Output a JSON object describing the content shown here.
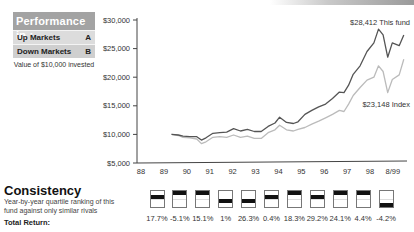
{
  "performance_box": {
    "title": "Performance in :",
    "rows": [
      {
        "label": "Up Markets",
        "grade": "A"
      },
      {
        "label": "Down Markets",
        "grade": "B"
      }
    ],
    "note": "Value of $10,000 invested"
  },
  "consistency": {
    "title": "Consistency",
    "description_line1": "Year-by-year quartile ranking of this",
    "description_line2": "fund against only similar rivals",
    "total_return_label": "Total Return:"
  },
  "chart_data": {
    "type": "line",
    "title": "Value of $10,000 invested",
    "xlabel": "",
    "ylabel": "",
    "ylim": [
      5000,
      30000
    ],
    "y_ticks": [
      "$30,000",
      "$25,000",
      "$20,000",
      "$15,000",
      "$10,000",
      "$5,000"
    ],
    "x_ticks": [
      "88",
      "89",
      "90",
      "91",
      "92",
      "93",
      "94",
      "95",
      "96",
      "97",
      "98",
      "8/99"
    ],
    "series": [
      {
        "name": "This fund",
        "end_label": "$28,412 This fund",
        "color": "#555555",
        "x": [
          89.5,
          89.8,
          90.0,
          90.3,
          90.6,
          90.8,
          91.0,
          91.3,
          91.6,
          91.9,
          92.2,
          92.5,
          92.8,
          93.1,
          93.4,
          93.7,
          94.0,
          94.2,
          94.5,
          94.8,
          95.0,
          95.3,
          95.6,
          95.9,
          96.2,
          96.5,
          96.8,
          97.0,
          97.2,
          97.4,
          97.7,
          98.0,
          98.3,
          98.5,
          98.7,
          98.9,
          99.1,
          99.4,
          99.6
        ],
        "values": [
          10000,
          9900,
          9700,
          9600,
          9600,
          9000,
          9400,
          10200,
          10300,
          10400,
          11000,
          10600,
          10900,
          10500,
          10500,
          11400,
          12000,
          13000,
          12100,
          11900,
          12200,
          13500,
          14200,
          14800,
          15300,
          16300,
          17400,
          17300,
          18600,
          20500,
          22000,
          24500,
          26000,
          28412,
          27400,
          23500,
          26000,
          25500,
          27400
        ]
      },
      {
        "name": "Index",
        "end_label": "$23,148 Index",
        "color": "#bbbbbb",
        "x": [
          89.5,
          89.8,
          90.0,
          90.3,
          90.6,
          90.8,
          91.0,
          91.3,
          91.6,
          91.9,
          92.2,
          92.5,
          92.8,
          93.1,
          93.4,
          93.7,
          94.0,
          94.2,
          94.5,
          94.8,
          95.0,
          95.3,
          95.6,
          95.9,
          96.2,
          96.5,
          96.8,
          97.0,
          97.2,
          97.4,
          97.7,
          98.0,
          98.3,
          98.5,
          98.7,
          98.9,
          99.1,
          99.4,
          99.6
        ],
        "values": [
          10000,
          9800,
          9500,
          9400,
          9200,
          8400,
          8700,
          9500,
          9600,
          9500,
          9900,
          9500,
          9700,
          9300,
          9300,
          10300,
          10800,
          11600,
          10800,
          10600,
          10900,
          11200,
          11800,
          12300,
          12900,
          13500,
          14200,
          14000,
          15300,
          16800,
          18200,
          19500,
          20000,
          22000,
          21000,
          17300,
          19600,
          20400,
          23148
        ]
      }
    ],
    "annotations": [
      "$28,412 This fund",
      "$23,148 Index"
    ],
    "grid": false,
    "legend": "inline end labels"
  },
  "quartiles": {
    "years": [
      "90",
      "91",
      "92",
      "93",
      "94",
      "95",
      "96",
      "97",
      "98",
      "99",
      "8/99"
    ],
    "rank": [
      2,
      1,
      1,
      3,
      3,
      2,
      1,
      2,
      1,
      1,
      4
    ],
    "returns": [
      "17.7%",
      "-5.1%",
      "15.1%",
      "1%",
      "26.3%",
      "0.4%",
      "18.3%",
      "29.2%",
      "24.1%",
      "4.4%",
      "-4.2%"
    ]
  }
}
